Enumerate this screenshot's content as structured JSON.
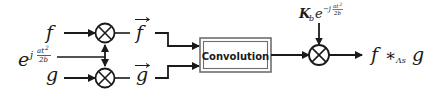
{
  "diagram": {
    "type": "signal-flow block diagram",
    "inputs": {
      "f": "f",
      "g": "g",
      "chirp_base": "e",
      "chirp_exp_prefix": "j",
      "chirp_exp_num": "at",
      "chirp_exp_num_pow": "2",
      "chirp_exp_den": "2b"
    },
    "intermediates": {
      "f_vec": "f",
      "g_vec": "g",
      "vec_arrow": "→"
    },
    "block": {
      "label": "Convolution"
    },
    "post_multiplier": {
      "K": "K",
      "K_sub": "b",
      "base": "e",
      "exp_prefix": "−j",
      "exp_num": "at",
      "exp_num_pow": "2",
      "exp_den": "2b"
    },
    "output": {
      "f": "f",
      "op": "∗",
      "op_sub": "Λs",
      "g": "g"
    },
    "multiplier_symbol": "⊗",
    "colors": {
      "stroke": "#1a1a1a",
      "box_fill": "#ffffff",
      "background": "#ffffff"
    }
  }
}
